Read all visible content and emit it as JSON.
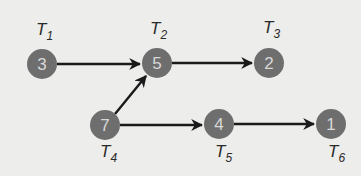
{
  "diagram": {
    "type": "directed-graph",
    "colors": {
      "node": "#6e6e6e",
      "node_text": "#d8d8d8",
      "edge": "#1a1a1a",
      "background": "#ededeb"
    },
    "nodes": [
      {
        "id": "T1",
        "label": "T",
        "sub": "1",
        "value": "3"
      },
      {
        "id": "T2",
        "label": "T",
        "sub": "2",
        "value": "5"
      },
      {
        "id": "T3",
        "label": "T",
        "sub": "3",
        "value": "2"
      },
      {
        "id": "T4",
        "label": "T",
        "sub": "4",
        "value": "7"
      },
      {
        "id": "T5",
        "label": "T",
        "sub": "5",
        "value": "4"
      },
      {
        "id": "T6",
        "label": "T",
        "sub": "6",
        "value": "1"
      }
    ],
    "edges": [
      {
        "from": "T1",
        "to": "T2"
      },
      {
        "from": "T2",
        "to": "T3"
      },
      {
        "from": "T4",
        "to": "T2"
      },
      {
        "from": "T4",
        "to": "T5"
      },
      {
        "from": "T5",
        "to": "T6"
      }
    ]
  }
}
